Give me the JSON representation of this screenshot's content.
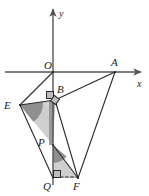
{
  "figure": {
    "background": "#ffffff",
    "stroke_color": "#2b2b2b",
    "axis_color": "#555555",
    "fill_light": "#cfcfcf",
    "fill_dark": "#9a9a9a",
    "width": 149,
    "height": 196
  },
  "axes": {
    "x_axis": {
      "label": "x",
      "label_x": 137,
      "label_y": 79,
      "x1": 5,
      "y1": 72,
      "x2": 145,
      "y2": 72,
      "arrow": "right"
    },
    "y_axis": {
      "label": "y",
      "label_x": 59,
      "label_y": 9,
      "x1": 53,
      "y1": 185,
      "x2": 53,
      "y2": 5,
      "arrow": "up"
    }
  },
  "points": [
    {
      "name": "O",
      "label": "O",
      "x": 53,
      "y": 72,
      "label_x": 44,
      "label_y": 60
    },
    {
      "name": "A",
      "label": "A",
      "x": 115,
      "y": 72,
      "label_x": 111,
      "label_y": 57
    },
    {
      "name": "B",
      "label": "B",
      "x": 55,
      "y": 100,
      "label_x": 57,
      "label_y": 84
    },
    {
      "name": "E",
      "label": "E",
      "x": 20,
      "y": 105,
      "label_x": 4,
      "label_y": 100
    },
    {
      "name": "P",
      "label": "P",
      "x": 53,
      "y": 145,
      "label_x": 38,
      "label_y": 137
    },
    {
      "name": "Q",
      "label": "Q",
      "x": 53,
      "y": 178,
      "label_x": 43,
      "label_y": 181
    },
    {
      "name": "F",
      "label": "F",
      "x": 78,
      "y": 178,
      "label_x": 73,
      "label_y": 181
    }
  ],
  "segments": [
    {
      "name": "O-E",
      "x1": 53,
      "y1": 72,
      "x2": 20,
      "y2": 105,
      "style": "solid"
    },
    {
      "name": "E-B",
      "x1": 20,
      "y1": 105,
      "x2": 55,
      "y2": 100,
      "style": "solid"
    },
    {
      "name": "B-A",
      "x1": 55,
      "y1": 100,
      "x2": 115,
      "y2": 72,
      "style": "solid"
    },
    {
      "name": "A-F",
      "x1": 115,
      "y1": 72,
      "x2": 78,
      "y2": 178,
      "style": "solid"
    },
    {
      "name": "B-F",
      "x1": 55,
      "y1": 100,
      "x2": 78,
      "y2": 178,
      "style": "solid"
    },
    {
      "name": "E-Q",
      "x1": 20,
      "y1": 105,
      "x2": 53,
      "y2": 178,
      "style": "solid"
    },
    {
      "name": "P-F",
      "x1": 53,
      "y1": 145,
      "x2": 78,
      "y2": 178,
      "style": "solid"
    },
    {
      "name": "Q-F",
      "x1": 53,
      "y1": 178,
      "x2": 78,
      "y2": 178,
      "style": "dashed"
    }
  ],
  "shaded_regions": [
    {
      "name": "triangle-E-B-P",
      "points": "20,105 55,100 53,145",
      "fill": "#cfcfcf"
    },
    {
      "name": "triangle-P-Q-F",
      "points": "53,145 53,178 78,178",
      "fill": "#cfcfcf"
    },
    {
      "name": "angle-arc-at-E",
      "fill": "#8f8f8f"
    },
    {
      "name": "angle-arc-at-P",
      "fill": "#8f8f8f"
    }
  ],
  "markers": [
    {
      "name": "right-angle-at-B",
      "kind": "square",
      "x": 47,
      "y": 92,
      "size": 7
    },
    {
      "name": "right-angle-rotated-at-B",
      "kind": "diamond",
      "x": 55,
      "y": 100,
      "size": 6
    },
    {
      "name": "right-angle-at-Q",
      "kind": "square",
      "x": 53,
      "y": 171,
      "size": 7
    }
  ]
}
